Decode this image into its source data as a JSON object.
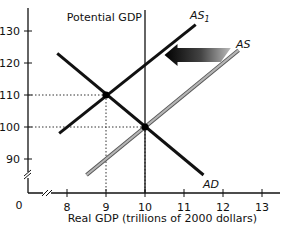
{
  "chart_data": {
    "type": "line",
    "title": "",
    "xlabel": "Real GDP (trillions of 2000 dollars)",
    "ylabel": "",
    "xlim": [
      7.5,
      13.3
    ],
    "ylim": [
      80,
      136
    ],
    "x_ticks": [
      8,
      9,
      10,
      11,
      12,
      13
    ],
    "x_tick_labels": [
      "8",
      "9",
      "10",
      "11",
      "12",
      "13"
    ],
    "y_ticks": [
      90,
      100,
      110,
      120,
      130
    ],
    "y_tick_labels": [
      "90",
      "100",
      "110",
      "120",
      "130"
    ],
    "origin_label": "0",
    "axis_breaks": true,
    "grid": false,
    "series": [
      {
        "name": "AD",
        "label": "AD",
        "color": "#111111",
        "points": [
          [
            7.75,
            123
          ],
          [
            11.5,
            85
          ]
        ]
      },
      {
        "name": "AS1",
        "label": "AS",
        "subscript": "1",
        "color": "#111111",
        "points": [
          [
            7.8,
            98
          ],
          [
            11.3,
            132
          ]
        ]
      },
      {
        "name": "AS",
        "label": "AS",
        "color": "#999999",
        "points": [
          [
            8.5,
            85
          ],
          [
            12.4,
            124
          ]
        ]
      }
    ],
    "vertical_lines": [
      {
        "name": "Potential GDP",
        "label": "Potential GDP",
        "x": 10
      }
    ],
    "equilibrium_points": [
      {
        "x": 9,
        "y": 110,
        "label": "AD ∩ AS1"
      },
      {
        "x": 10,
        "y": 100,
        "label": "AD ∩ AS"
      }
    ],
    "guide_lines": [
      {
        "x": 9,
        "y": 110,
        "style": "dotted"
      },
      {
        "x": 10,
        "y": 100,
        "style": "dotted"
      }
    ],
    "annotations": [
      {
        "type": "arrow",
        "direction": "left",
        "from": [
          12.2,
          122.5
        ],
        "to": [
          10.5,
          122.5
        ],
        "meaning": "AS shifts leftward to AS1"
      }
    ]
  }
}
